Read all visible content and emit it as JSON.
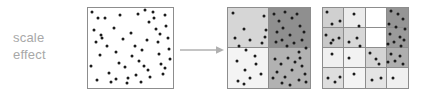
{
  "figure": {
    "title": "scale effect",
    "background_color": "#ffffff"
  },
  "caption": {
    "line1": "scale",
    "line2": "effect",
    "color": "#a8a8a8"
  },
  "arrow": {
    "name": "rightward-arrow",
    "color": "#b0b0b0",
    "direction": "right"
  },
  "palette": {
    "dot_color": "#1b1b1b",
    "border_color": "#8d8d8d",
    "shade_white": "#ffffff",
    "shade_lightest": "#f2f2f2",
    "shade_lighter": "#e6e6e6",
    "shade_light": "#dadada",
    "shade_medium_light": "#cfcfcf",
    "shade_medium": "#bdbdbd",
    "shade_medium_dark": "#a8a8a8",
    "shade_dark": "#8f8f8f"
  },
  "chart_data": {
    "type": "scatter",
    "title": "scale effect",
    "xlabel": "",
    "ylabel": "",
    "xlim": [
      0,
      100
    ],
    "ylim": [
      0,
      100
    ],
    "grid": false,
    "legend": null,
    "panels": [
      {
        "name": "raw-points",
        "label": "",
        "grid_rows": 1,
        "grid_cols": 1,
        "points": [
          [
            5,
            95
          ],
          [
            7,
            72
          ],
          [
            9,
            58
          ],
          [
            4,
            27
          ],
          [
            10,
            10
          ],
          [
            15,
            66
          ],
          [
            17,
            63
          ],
          [
            14,
            41
          ],
          [
            20,
            87
          ],
          [
            22,
            53
          ],
          [
            25,
            19
          ],
          [
            27,
            7
          ],
          [
            30,
            75
          ],
          [
            33,
            45
          ],
          [
            36,
            31
          ],
          [
            38,
            91
          ],
          [
            41,
            61
          ],
          [
            44,
            26
          ],
          [
            47,
            12
          ],
          [
            50,
            69
          ],
          [
            52,
            40
          ],
          [
            55,
            52
          ],
          [
            57,
            16
          ],
          [
            60,
            34
          ],
          [
            62,
            8
          ],
          [
            64,
            47
          ],
          [
            66,
            28
          ],
          [
            69,
            60
          ],
          [
            71,
            22
          ],
          [
            73,
            14
          ],
          [
            76,
            95
          ],
          [
            78,
            88
          ],
          [
            80,
            74
          ],
          [
            82,
            57
          ],
          [
            84,
            43
          ],
          [
            86,
            30
          ],
          [
            88,
            18
          ],
          [
            90,
            91
          ],
          [
            92,
            78
          ],
          [
            94,
            63
          ],
          [
            95,
            49
          ],
          [
            97,
            36
          ],
          [
            72,
            83
          ],
          [
            85,
            67
          ],
          [
            91,
            25
          ],
          [
            67,
            97
          ],
          [
            59,
            93
          ],
          [
            46,
            6
          ],
          [
            33,
            11
          ],
          [
            12,
            88
          ]
        ]
      },
      {
        "name": "grid-2x2",
        "label": "",
        "grid_rows": 2,
        "grid_cols": 2,
        "cells": [
          {
            "row": 0,
            "col": 0,
            "count": 11,
            "shade": "#d6d6d6"
          },
          {
            "row": 0,
            "col": 1,
            "count": 17,
            "shade": "#8f8f8f"
          },
          {
            "row": 1,
            "col": 0,
            "count": 7,
            "shade": "#f4f4f4"
          },
          {
            "row": 1,
            "col": 1,
            "count": 15,
            "shade": "#b2b2b2"
          }
        ],
        "points": [
          [
            6,
            94
          ],
          [
            19,
            74
          ],
          [
            27,
            60
          ],
          [
            9,
            62
          ],
          [
            14,
            53
          ],
          [
            22,
            47
          ],
          [
            33,
            40
          ],
          [
            41,
            56
          ],
          [
            44,
            90
          ],
          [
            45,
            64
          ],
          [
            46,
            72
          ],
          [
            56,
            92
          ],
          [
            62,
            84
          ],
          [
            70,
            95
          ],
          [
            78,
            88
          ],
          [
            84,
            93
          ],
          [
            60,
            70
          ],
          [
            67,
            75
          ],
          [
            75,
            66
          ],
          [
            88,
            78
          ],
          [
            93,
            70
          ],
          [
            58,
            58
          ],
          [
            66,
            60
          ],
          [
            72,
            52
          ],
          [
            80,
            56
          ],
          [
            90,
            60
          ],
          [
            95,
            50
          ],
          [
            86,
            45
          ],
          [
            11,
            34
          ],
          [
            21,
            23
          ],
          [
            34,
            30
          ],
          [
            27,
            12
          ],
          [
            12,
            9
          ],
          [
            20,
            5
          ],
          [
            40,
            17
          ],
          [
            57,
            36
          ],
          [
            65,
            30
          ],
          [
            73,
            38
          ],
          [
            82,
            33
          ],
          [
            90,
            28
          ],
          [
            60,
            20
          ],
          [
            70,
            14
          ],
          [
            78,
            22
          ],
          [
            86,
            10
          ],
          [
            94,
            18
          ],
          [
            66,
            6
          ],
          [
            76,
            4
          ],
          [
            55,
            12
          ],
          [
            88,
            38
          ],
          [
            95,
            8
          ]
        ]
      },
      {
        "name": "grid-4x4",
        "label": "",
        "grid_rows": 4,
        "grid_cols": 4,
        "cells": [
          {
            "row": 0,
            "col": 0,
            "count": 3,
            "shade": "#d0d0d0"
          },
          {
            "row": 0,
            "col": 1,
            "count": 2,
            "shade": "#ececec"
          },
          {
            "row": 0,
            "col": 2,
            "count": 0,
            "shade": "#ffffff"
          },
          {
            "row": 0,
            "col": 3,
            "count": 6,
            "shade": "#959595"
          },
          {
            "row": 1,
            "col": 0,
            "count": 4,
            "shade": "#c8c8c8"
          },
          {
            "row": 1,
            "col": 1,
            "count": 3,
            "shade": "#d8d8d8"
          },
          {
            "row": 1,
            "col": 2,
            "count": 0,
            "shade": "#ffffff"
          },
          {
            "row": 1,
            "col": 3,
            "count": 6,
            "shade": "#9a9a9a"
          },
          {
            "row": 2,
            "col": 0,
            "count": 1,
            "shade": "#f0f0f0"
          },
          {
            "row": 2,
            "col": 1,
            "count": 1,
            "shade": "#f2f2f2"
          },
          {
            "row": 2,
            "col": 2,
            "count": 3,
            "shade": "#d4d4d4"
          },
          {
            "row": 2,
            "col": 3,
            "count": 5,
            "shade": "#aeaeae"
          },
          {
            "row": 3,
            "col": 0,
            "count": 3,
            "shade": "#dedede"
          },
          {
            "row": 3,
            "col": 1,
            "count": 1,
            "shade": "#f4f4f4"
          },
          {
            "row": 3,
            "col": 2,
            "count": 2,
            "shade": "#e4e4e4"
          },
          {
            "row": 3,
            "col": 3,
            "count": 1,
            "shade": "#f0f0f0"
          }
        ],
        "points": [
          [
            5,
            95
          ],
          [
            11,
            80
          ],
          [
            20,
            84
          ],
          [
            36,
            92
          ],
          [
            42,
            78
          ],
          [
            80,
            96
          ],
          [
            88,
            92
          ],
          [
            94,
            86
          ],
          [
            78,
            80
          ],
          [
            86,
            76
          ],
          [
            96,
            74
          ],
          [
            4,
            66
          ],
          [
            12,
            60
          ],
          [
            19,
            63
          ],
          [
            9,
            56
          ],
          [
            30,
            58
          ],
          [
            40,
            62
          ],
          [
            44,
            52
          ],
          [
            79,
            68
          ],
          [
            90,
            64
          ],
          [
            84,
            58
          ],
          [
            95,
            60
          ],
          [
            77,
            55
          ],
          [
            92,
            52
          ],
          [
            10,
            42
          ],
          [
            31,
            38
          ],
          [
            55,
            44
          ],
          [
            62,
            36
          ],
          [
            66,
            30
          ],
          [
            80,
            42
          ],
          [
            90,
            40
          ],
          [
            85,
            34
          ],
          [
            94,
            30
          ],
          [
            76,
            32
          ],
          [
            6,
            12
          ],
          [
            14,
            8
          ],
          [
            20,
            14
          ],
          [
            37,
            18
          ],
          [
            58,
            10
          ],
          [
            68,
            12
          ],
          [
            82,
            12
          ]
        ]
      }
    ]
  }
}
